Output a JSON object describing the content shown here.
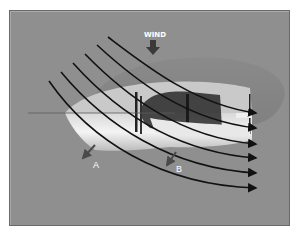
{
  "diagram": {
    "title_label": "WIND",
    "force_labels": {
      "a": "A",
      "b": "B"
    },
    "colors": {
      "background": "#8f8f8f",
      "frame_border": "#6a6a6a",
      "flow_lines": "#111111",
      "hull": "#f2f2f2",
      "shadow": "#7a7a7a",
      "label_text": "#ffffff"
    },
    "flow_lines": [
      {
        "start": [
          49,
          81
        ],
        "end": [
          258,
          188
        ]
      },
      {
        "start": [
          61,
          72
        ],
        "end": [
          258,
          173
        ]
      },
      {
        "start": [
          73,
          63
        ],
        "end": [
          258,
          158
        ]
      },
      {
        "start": [
          85,
          54
        ],
        "end": [
          258,
          144
        ]
      },
      {
        "start": [
          97,
          45
        ],
        "end": [
          258,
          128
        ]
      },
      {
        "start": [
          108,
          37
        ],
        "end": [
          258,
          113
        ]
      }
    ],
    "force_arrows": [
      {
        "label": "A",
        "from": [
          95,
          145
        ],
        "to": [
          81,
          160
        ]
      },
      {
        "label": "B",
        "from": [
          176,
          152
        ],
        "to": [
          165,
          167
        ]
      }
    ],
    "wind_arrow": {
      "x": 153,
      "y_from": 40,
      "y_to": 55
    }
  }
}
